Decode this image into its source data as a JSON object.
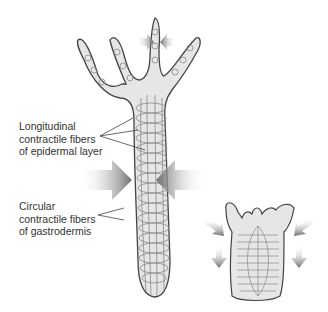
{
  "diagram": {
    "labels": {
      "epidermal": [
        "Longitudinal",
        "contractile fibers",
        "of epidermal layer"
      ],
      "gastrodermis": [
        "Circular",
        "contractile fibers",
        "of gastrodermis"
      ]
    },
    "colors": {
      "body_fill": "#e6e6e6",
      "outline": "#444444",
      "fiber": "#888888",
      "arrow": "#7a7a7a"
    },
    "figures": [
      "extended-hydra",
      "contracted-hydra"
    ]
  }
}
